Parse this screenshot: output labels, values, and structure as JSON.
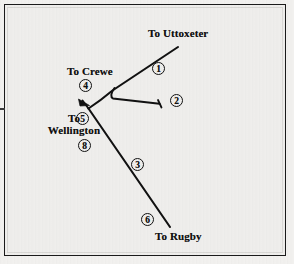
{
  "figure": {
    "kind": "schematic-route-diagram",
    "background_color": "#efeeec",
    "frame_color": "#1a1a1a",
    "line_color": "#111111"
  },
  "destinations": {
    "uttoxeter": "To Uttoxeter",
    "crewe": "To Crewe",
    "wellington_line1": "To",
    "wellington_line2": "Wellington",
    "rugby": "To Rugby"
  },
  "route_markers": [
    {
      "id": "marker-1",
      "label": "①",
      "number": "1"
    },
    {
      "id": "marker-2",
      "label": "②",
      "number": "2"
    },
    {
      "id": "marker-3",
      "label": "③",
      "number": "3"
    },
    {
      "id": "marker-4",
      "label": "④",
      "number": "4"
    },
    {
      "id": "marker-5",
      "label": "⑤",
      "number": "5"
    },
    {
      "id": "marker-6",
      "label": "⑥",
      "number": "6"
    },
    {
      "id": "marker-8",
      "label": "⑧",
      "number": "8"
    }
  ]
}
